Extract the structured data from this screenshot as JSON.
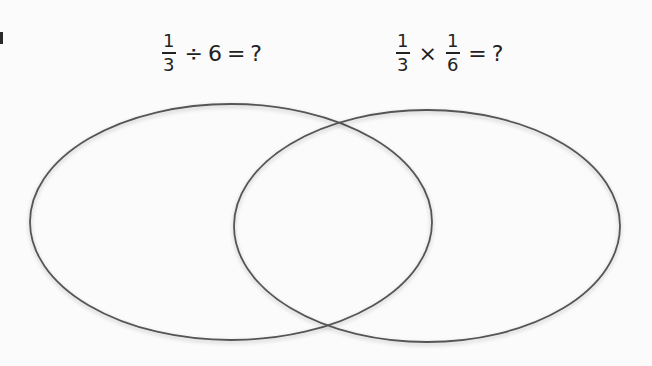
{
  "diagram": {
    "type": "venn",
    "sets": [
      {
        "id": "left",
        "label": {
          "fraction": {
            "numerator": "1",
            "denominator": "3"
          },
          "operator": "÷",
          "operand": "6",
          "equals": "=",
          "result": "?"
        },
        "label_text": "1/3 ÷ 6 = ?",
        "ellipse": {
          "cx": 231,
          "cy": 222,
          "rx": 201,
          "ry": 118
        }
      },
      {
        "id": "right",
        "label": {
          "fraction": {
            "numerator": "1",
            "denominator": "3"
          },
          "operator": "×",
          "operand_fraction": {
            "numerator": "1",
            "denominator": "6"
          },
          "equals": "=",
          "result": "?"
        },
        "label_text": "1/3 × 1/6 = ?",
        "ellipse": {
          "cx": 427,
          "cy": 226,
          "rx": 193,
          "ry": 116
        }
      }
    ],
    "regions": {
      "left_only": "",
      "overlap": "",
      "right_only": ""
    },
    "stroke_color": "#555555",
    "background_color": "#fbfbfb"
  }
}
